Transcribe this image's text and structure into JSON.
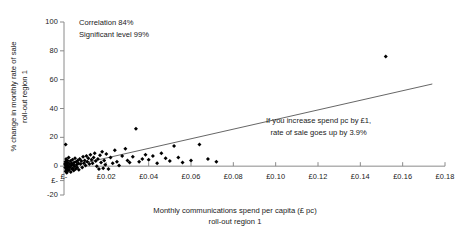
{
  "chart_data": {
    "type": "scatter",
    "title": "",
    "xlabel": "Monthly communications spend per capita (£ pc)\nroll-out region 1",
    "xlabel_line1": "Monthly communications spend per capita (£ pc)",
    "xlabel_line2": "roll-out region 1",
    "ylabel": "% change in monthly rate of sale\nroll-out region 1",
    "ylabel_line1": "% change in monthly rate of sale",
    "ylabel_line2": "roll-out region 1",
    "xlim": [
      0,
      0.18
    ],
    "ylim": [
      -20,
      100
    ],
    "grid": false,
    "legend": "none",
    "marker_color": "#000000",
    "trendline_color": "#555555",
    "axis_color": "#8a8a8a",
    "xticks": [
      0,
      0.02,
      0.04,
      0.06,
      0.08,
      0.1,
      0.12,
      0.14,
      0.16,
      0.18
    ],
    "xticklabels": [
      "£-",
      "£0.02",
      "£0.04",
      "£0.06",
      "£0.08",
      "£0.10",
      "£0.12",
      "£0.14",
      "£0.16",
      "£0.18"
    ],
    "yticks": [
      100,
      80,
      60,
      40,
      20,
      0,
      -10,
      -20
    ],
    "yticklabels": [
      "100",
      "80",
      "60",
      "40",
      "20",
      "0",
      "£-",
      "-20"
    ],
    "series": [
      {
        "name": "roll-out region 1 stores",
        "marker": "diamond",
        "points": [
          [
            0.0005,
            1.5
          ],
          [
            0.0006,
            -1.0
          ],
          [
            0.0007,
            3.0
          ],
          [
            0.0008,
            -3.5
          ],
          [
            0.0009,
            0.5
          ],
          [
            0.001,
            5.0
          ],
          [
            0.0011,
            -2.0
          ],
          [
            0.0012,
            2.0
          ],
          [
            0.0013,
            -4.5
          ],
          [
            0.0014,
            1.0
          ],
          [
            0.0015,
            -1.5
          ],
          [
            0.0016,
            4.0
          ],
          [
            0.0017,
            -0.5
          ],
          [
            0.0018,
            2.5
          ],
          [
            0.0019,
            -3.0
          ],
          [
            0.002,
            0.0
          ],
          [
            0.0022,
            6.0
          ],
          [
            0.0024,
            -2.5
          ],
          [
            0.0026,
            1.5
          ],
          [
            0.0028,
            -1.0
          ],
          [
            0.003,
            3.5
          ],
          [
            0.0032,
            -4.0
          ],
          [
            0.0034,
            0.5
          ],
          [
            0.0036,
            2.0
          ],
          [
            0.0038,
            -2.0
          ],
          [
            0.004,
            4.5
          ],
          [
            0.0042,
            -1.5
          ],
          [
            0.0044,
            1.0
          ],
          [
            0.0046,
            -3.0
          ],
          [
            0.0048,
            2.5
          ],
          [
            0.005,
            0.0
          ],
          [
            0.0052,
            5.5
          ],
          [
            0.0008,
            15.0
          ],
          [
            0.0055,
            -2.0
          ],
          [
            0.0058,
            3.0
          ],
          [
            0.006,
            1.0
          ],
          [
            0.0062,
            -1.0
          ],
          [
            0.0065,
            4.0
          ],
          [
            0.0068,
            2.0
          ],
          [
            0.007,
            -2.5
          ],
          [
            0.0074,
            5.0
          ],
          [
            0.0078,
            1.5
          ],
          [
            0.0082,
            3.5
          ],
          [
            0.0086,
            -1.0
          ],
          [
            0.009,
            6.5
          ],
          [
            0.0094,
            2.0
          ],
          [
            0.0098,
            4.0
          ],
          [
            0.0102,
            0.5
          ],
          [
            0.0106,
            7.0
          ],
          [
            0.011,
            3.0
          ],
          [
            0.0115,
            5.5
          ],
          [
            0.012,
            1.5
          ],
          [
            0.0125,
            8.0
          ],
          [
            0.013,
            4.5
          ],
          [
            0.0135,
            2.0
          ],
          [
            0.014,
            6.0
          ],
          [
            0.0145,
            9.0
          ],
          [
            0.015,
            3.5
          ],
          [
            0.0155,
            0.0
          ],
          [
            0.016,
            5.0
          ],
          [
            0.0165,
            -2.0
          ],
          [
            0.017,
            7.5
          ],
          [
            0.0175,
            2.5
          ],
          [
            0.018,
            10.0
          ],
          [
            0.0185,
            -1.5
          ],
          [
            0.019,
            4.0
          ],
          [
            0.0195,
            1.0
          ],
          [
            0.02,
            8.5
          ],
          [
            0.021,
            -2.0
          ],
          [
            0.022,
            6.0
          ],
          [
            0.023,
            2.0
          ],
          [
            0.024,
            11.0
          ],
          [
            0.025,
            3.0
          ],
          [
            0.026,
            0.5
          ],
          [
            0.0275,
            7.0
          ],
          [
            0.029,
            12.0
          ],
          [
            0.03,
            4.0
          ],
          [
            0.031,
            2.5
          ],
          [
            0.0325,
            6.5
          ],
          [
            0.034,
            26.0
          ],
          [
            0.0355,
            3.0
          ],
          [
            0.037,
            5.0
          ],
          [
            0.0385,
            8.0
          ],
          [
            0.04,
            4.5
          ],
          [
            0.042,
            7.0
          ],
          [
            0.044,
            2.0
          ],
          [
            0.046,
            9.0
          ],
          [
            0.048,
            5.5
          ],
          [
            0.05,
            3.5
          ],
          [
            0.052,
            14.0
          ],
          [
            0.054,
            6.0
          ],
          [
            0.056,
            2.5
          ],
          [
            0.06,
            4.0
          ],
          [
            0.064,
            15.0
          ],
          [
            0.068,
            5.0
          ],
          [
            0.072,
            3.0
          ],
          [
            0.152,
            76.0
          ]
        ]
      }
    ],
    "trendline": {
      "description": "linear fit",
      "x_start": 0.0,
      "y_start": -1.0,
      "x_end": 0.174,
      "y_end": 57.0,
      "slope_percent_per_pound": 3.9
    },
    "annotations": [
      {
        "id": "correlation",
        "line1": "Correlation 84%",
        "line2": "Significant level 99%"
      },
      {
        "id": "slope",
        "line1": "If you increase spend pc by £1,",
        "line2": "rate of sale goes up by 3.9%"
      }
    ]
  }
}
